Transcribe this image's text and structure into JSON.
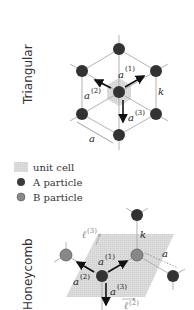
{
  "panels": {
    "triangular": {
      "label": "Triangular",
      "vectors": {
        "a1": "a",
        "a1_sup": "(1)",
        "a2": "a",
        "a2_sup": "(2)",
        "a3": "a",
        "a3_sup": "(3)"
      },
      "spring_label": "k",
      "distance_label": "a"
    },
    "honeycomb": {
      "label": "Honeycomb",
      "vectors": {
        "a1": "a",
        "a1_sup": "(1)",
        "a2": "a",
        "a2_sup": "(2)",
        "a3": "a",
        "a3_sup": "(3)"
      },
      "lattice_vectors": {
        "l2": "ℓ",
        "l2_sup": "(2)",
        "l3": "ℓ",
        "l3_sup": "(3)"
      },
      "spring_label": "k",
      "distance_label": "a"
    }
  },
  "legend": {
    "items": [
      {
        "label": "unit cell",
        "color": "#d8d8d8"
      },
      {
        "label": "A particle",
        "color": "#3a3a3a"
      },
      {
        "label": "B particle",
        "color": "#8a8a8a"
      }
    ]
  },
  "colors": {
    "a_particle": "#333333",
    "b_particle": "#888888",
    "bond": "#aaaaaa",
    "unit_cell": "#d6d6d6",
    "arrow": "#111111"
  }
}
